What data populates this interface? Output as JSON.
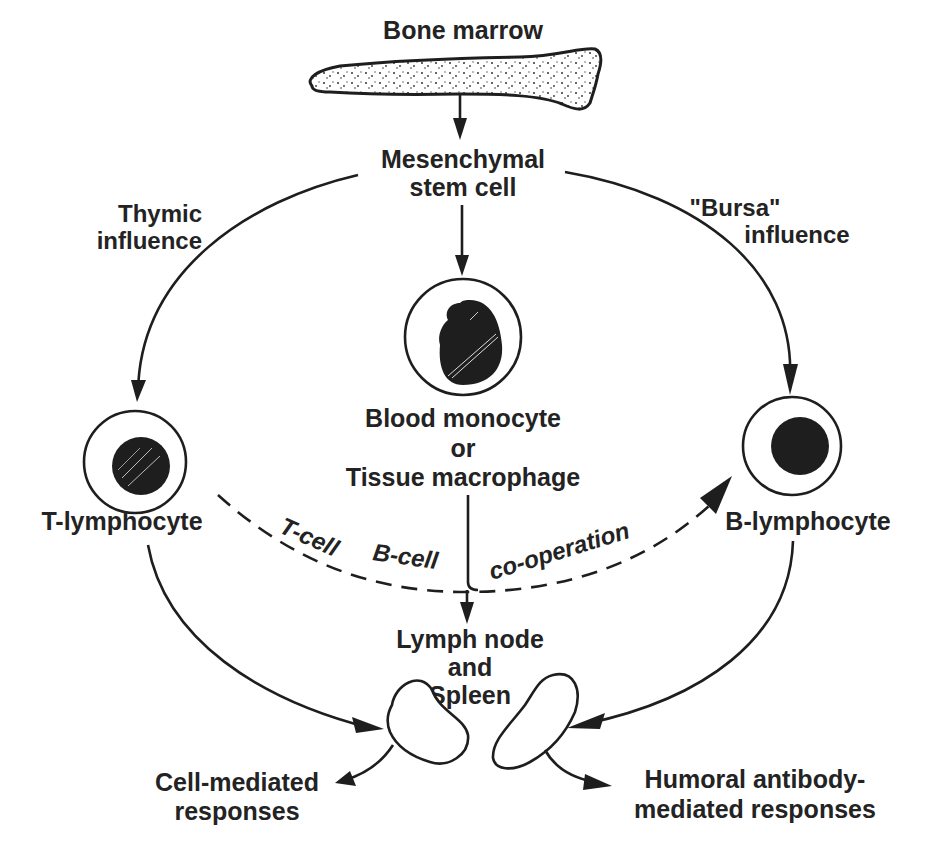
{
  "diagram": {
    "nodes": {
      "bone_marrow": "Bone marrow",
      "stem_cell": [
        "Mesenchymal",
        "stem cell"
      ],
      "thymic": [
        "Thymic",
        "influence"
      ],
      "bursa": [
        "\"Bursa\"",
        "influence"
      ],
      "monocyte": [
        "Blood monocyte",
        "or",
        "Tissue macrophage"
      ],
      "t_lymphocyte": "T-lymphocyte",
      "b_lymphocyte": "B-lymphocyte",
      "lymph_node": [
        "Lymph node",
        "and",
        "Spleen"
      ],
      "cell_mediated": [
        "Cell-mediated",
        "responses"
      ],
      "humoral": [
        "Humoral antibody-",
        "mediated responses"
      ]
    },
    "cooperation_label": [
      "T-cell",
      "B-cell",
      "co-operation"
    ],
    "edges": [
      {
        "from": "Bone marrow",
        "to": "Mesenchymal stem cell",
        "style": "solid"
      },
      {
        "from": "Mesenchymal stem cell",
        "to": "T-lymphocyte",
        "via": "Thymic influence",
        "style": "solid"
      },
      {
        "from": "Mesenchymal stem cell",
        "to": "B-lymphocyte",
        "via": "\"Bursa\" influence",
        "style": "solid"
      },
      {
        "from": "Mesenchymal stem cell",
        "to": "Blood monocyte or Tissue macrophage",
        "style": "solid"
      },
      {
        "from": "T-lymphocyte",
        "to": "B-lymphocyte",
        "via": "T-cell B-cell co-operation",
        "style": "dashed"
      },
      {
        "from": "Blood monocyte or Tissue macrophage",
        "to": "Lymph node and Spleen",
        "style": "solid"
      },
      {
        "from": "T-lymphocyte",
        "to": "Lymph node and Spleen",
        "style": "solid"
      },
      {
        "from": "B-lymphocyte",
        "to": "Lymph node and Spleen",
        "style": "solid"
      },
      {
        "from": "Lymph node and Spleen",
        "to": "Cell-mediated responses",
        "style": "solid"
      },
      {
        "from": "Lymph node and Spleen",
        "to": "Humoral antibody-mediated responses",
        "style": "solid"
      }
    ]
  }
}
